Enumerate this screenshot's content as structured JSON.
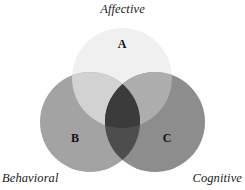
{
  "diagram": {
    "type": "venn-3-circle",
    "background_color": "#ffffff",
    "outer_labels": {
      "top": "Affective",
      "bottom_left": "Behavioral",
      "bottom_right": "Cognitive"
    },
    "regions": [
      {
        "letter": "A",
        "belongs_to": "Affective",
        "fill": "#f0f0f0"
      },
      {
        "letter": "B",
        "belongs_to": "Behavioral",
        "fill": "#a3a3a3"
      },
      {
        "letter": "C",
        "belongs_to": "Cognitive",
        "fill": "#8d8d8d"
      }
    ],
    "circles": [
      {
        "id": "affective",
        "cx": 122,
        "cy": 78,
        "r": 50,
        "fill": "#f0f0f0"
      },
      {
        "id": "behavioral",
        "cx": 90,
        "cy": 122,
        "r": 50,
        "fill": "#a3a3a3"
      },
      {
        "id": "cognitive",
        "cx": 155,
        "cy": 122,
        "r": 50,
        "fill": "#8d8d8d"
      }
    ],
    "overlaps": [
      {
        "id": "affective-behavioral",
        "fill": "#d2d2d2"
      },
      {
        "id": "affective-cognitive",
        "fill": "#adadad"
      },
      {
        "id": "behavioral-cognitive",
        "fill": "#4d4d4d"
      },
      {
        "id": "all-three",
        "fill": "#3b3b3b"
      }
    ],
    "text_color": "#1a1a1a",
    "letter_color": "#111111"
  }
}
